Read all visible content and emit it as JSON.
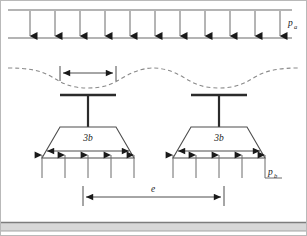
{
  "figure": {
    "name": "foundation-settlement-diagram",
    "background_color": "#ffffff",
    "border_color": "#b9b9b9",
    "width": 307,
    "height": 236
  },
  "labels": {
    "surcharge_pressure": "p",
    "surcharge_pressure_sub": "a",
    "bearing_pressure": "p",
    "bearing_pressure_sub": "b",
    "footing_width_left": "3b",
    "footing_width_right": "3b",
    "spacing": "e"
  },
  "colors": {
    "line": "#4d4d4d",
    "dark_line": "#2b2b2b",
    "arrow_fill": "#1a1a1a",
    "dashed_curve": "#8a8a8a",
    "ground_band_top": "#9a9a9a",
    "ground_band_fill": "#d8d8d8",
    "dimension_line": "#6b6b6b"
  },
  "geometry": {
    "surcharge": {
      "top_line_y": 10,
      "bottom_line_y": 38,
      "x_start": 8,
      "x_end": 292,
      "arrow_count": 11
    },
    "settlement_curve": {
      "y_base": 70,
      "dash_pattern": "4,3"
    },
    "footings": [
      {
        "id": "left-footing",
        "center_x": 88,
        "cap_y": 95,
        "cap_half_width": 28,
        "stem_bottom_y": 127,
        "trap_top_y": 127,
        "trap_bottom_y": 158,
        "trap_top_half": 28,
        "trap_bottom_half": 46,
        "label": "3b",
        "bearing_arrow_count": 5
      },
      {
        "id": "right-footing",
        "center_x": 219,
        "cap_y": 95,
        "cap_half_width": 28,
        "stem_bottom_y": 127,
        "trap_top_y": 127,
        "trap_bottom_y": 158,
        "trap_top_half": 28,
        "trap_bottom_half": 46,
        "label": "3b",
        "bearing_arrow_count": 5
      }
    ],
    "width_dimension": {
      "y": 73,
      "x_left": 60,
      "x_right": 116
    },
    "spacing_dimension": {
      "y": 197,
      "x_left": 83,
      "x_right": 224
    },
    "ground_band": {
      "y": 222,
      "height": 9
    }
  }
}
